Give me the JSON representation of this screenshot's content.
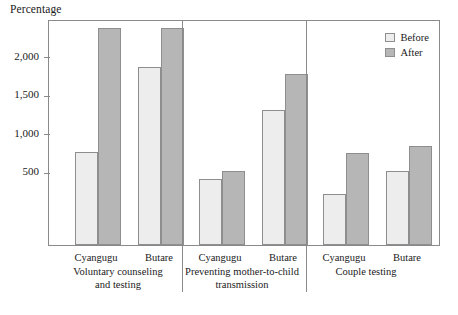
{
  "axis_title": "Percentage",
  "legend": {
    "position": "top-right",
    "entries": [
      {
        "label": "Before",
        "color": "#ededed",
        "swatch": "before-swatch"
      },
      {
        "label": "After",
        "color": "#b6b6b6",
        "swatch": "after-swatch"
      }
    ]
  },
  "yaxis": {
    "ticks": [
      {
        "label": "500",
        "value": 500
      },
      {
        "label": "1,000",
        "value": 1000
      },
      {
        "label": "1,500",
        "value": 1500
      },
      {
        "label": "2,000",
        "value": 2000
      }
    ]
  },
  "groups": [
    {
      "title_line1": "Voluntary counseling",
      "title_line2": "and testing",
      "categories": [
        {
          "label": "Cyangugu",
          "before": 750,
          "after": 2400
        },
        {
          "label": "Butare",
          "before": 1850,
          "after": 2400
        }
      ]
    },
    {
      "title_line1": "Preventing mother-to-child",
      "title_line2": "transmission",
      "categories": [
        {
          "label": "Cyangugu",
          "before": 400,
          "after": 500
        },
        {
          "label": "Butare",
          "before": 1290,
          "after": 1760
        }
      ]
    },
    {
      "title_line1": "Couple testing",
      "title_line2": "",
      "categories": [
        {
          "label": "Cyangugu",
          "before": 210,
          "after": 740
        },
        {
          "label": "Butare",
          "before": 500,
          "after": 830
        }
      ]
    }
  ],
  "chart_data": {
    "type": "bar",
    "title": "",
    "subtitle": "",
    "xlabel": "",
    "ylabel": "Percentage",
    "ylim": [
      0,
      2480
    ],
    "grid": false,
    "legend_position": "top-right",
    "yticks": [
      500,
      1000,
      1500,
      2000
    ],
    "ytick_labels": [
      "500",
      "1,000",
      "1,500",
      "2,000"
    ],
    "group_labels": [
      "Voluntary counseling and testing",
      "Preventing mother-to-child transmission",
      "Couple testing"
    ],
    "categories": [
      "Voluntary counseling and testing — Cyangugu",
      "Voluntary counseling and testing — Butare",
      "Preventing mother-to-child transmission — Cyangugu",
      "Preventing mother-to-child transmission — Butare",
      "Couple testing — Cyangugu",
      "Couple testing — Butare"
    ],
    "series": [
      {
        "name": "Before",
        "color": "#ededed",
        "values": [
          750,
          1850,
          400,
          1290,
          210,
          500
        ]
      },
      {
        "name": "After",
        "color": "#b6b6b6",
        "values": [
          2400,
          2400,
          500,
          1760,
          740,
          830
        ]
      }
    ]
  },
  "render": {
    "plot": {
      "left": 48,
      "top": 20,
      "width": 392,
      "height": 226
    },
    "value_at_baseline": -460,
    "value_at_top": 2480,
    "bar_width": 23,
    "group_centers": [
      118,
      242,
      366
    ],
    "separators": [
      182,
      306
    ],
    "bar_slots": [
      {
        "x": 74,
        "series": "before",
        "value": 750
      },
      {
        "x": 97,
        "series": "after",
        "value": 2400
      },
      {
        "x": 137,
        "series": "before",
        "value": 1850
      },
      {
        "x": 160,
        "series": "after",
        "value": 2400
      },
      {
        "x": 198,
        "series": "before",
        "value": 400
      },
      {
        "x": 221,
        "series": "after",
        "value": 500
      },
      {
        "x": 261,
        "series": "before",
        "value": 1290
      },
      {
        "x": 284,
        "series": "after",
        "value": 1760
      },
      {
        "x": 322,
        "series": "before",
        "value": 210
      },
      {
        "x": 345,
        "series": "after",
        "value": 740
      },
      {
        "x": 385,
        "series": "before",
        "value": 500
      },
      {
        "x": 408,
        "series": "after",
        "value": 830
      }
    ],
    "cat_label_xs": [
      96,
      159,
      220,
      283,
      344,
      407
    ],
    "cat_label_y": 252,
    "group_label_y": 266
  }
}
